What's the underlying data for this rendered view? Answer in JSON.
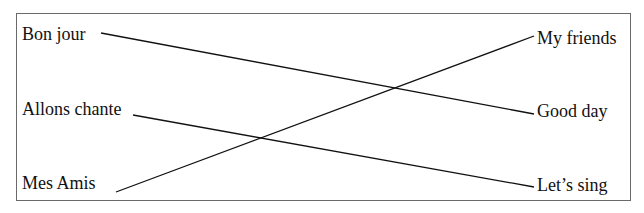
{
  "left_items": [
    {
      "text": "Bon jour",
      "x": 22,
      "y": 24
    },
    {
      "text": "Allons chante",
      "x": 22,
      "y": 99
    },
    {
      "text": "Mes Amis",
      "x": 22,
      "y": 173
    }
  ],
  "right_items": [
    {
      "text": "My friends",
      "x": 537,
      "y": 28
    },
    {
      "text": "Good day",
      "x": 537,
      "y": 101
    },
    {
      "text": "Let’s sing",
      "x": 537,
      "y": 175
    }
  ],
  "connections": [
    {
      "from": "Bon jour",
      "to": "Good day",
      "x1": 101,
      "y1": 33,
      "x2": 534,
      "y2": 114
    },
    {
      "from": "Allons chante",
      "to": "Let’s sing",
      "x1": 133,
      "y1": 115,
      "x2": 534,
      "y2": 187
    },
    {
      "from": "Mes Amis",
      "to": "My friends",
      "x1": 116,
      "y1": 192,
      "x2": 534,
      "y2": 36
    }
  ],
  "colors": {
    "line": "#111111",
    "border": "#6a6a6a"
  }
}
